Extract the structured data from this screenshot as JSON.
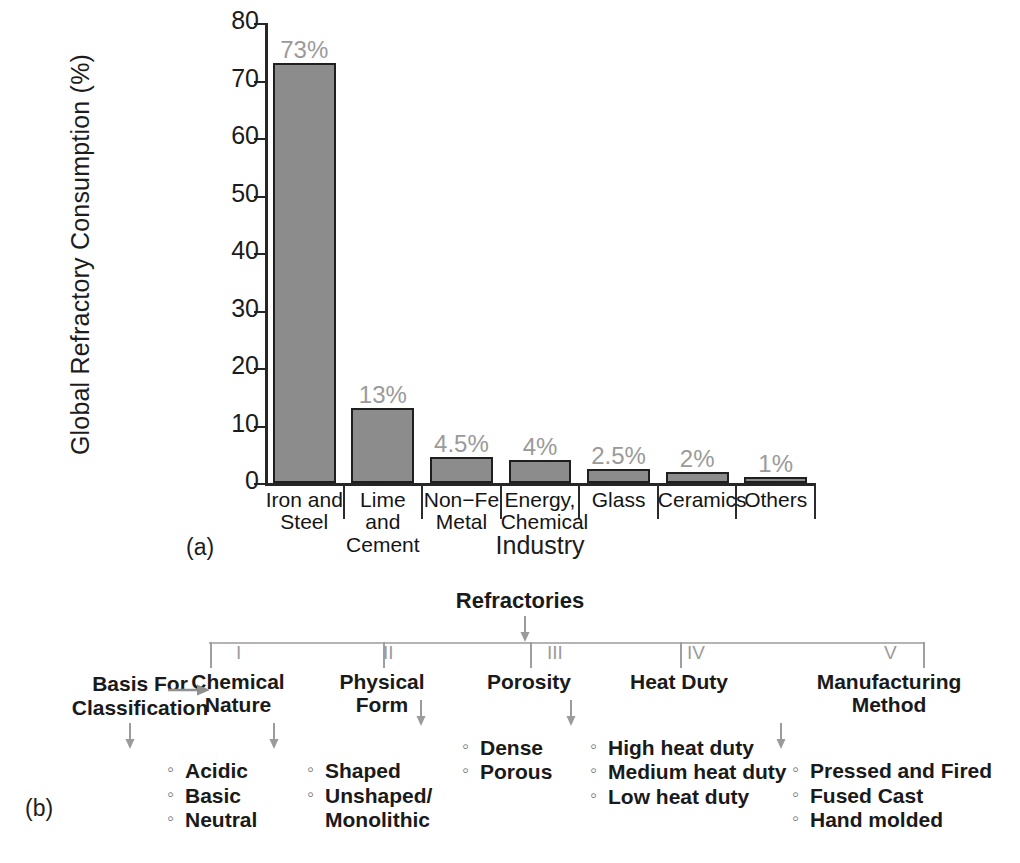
{
  "chart_data": {
    "type": "bar",
    "title": "",
    "xlabel": "Industry",
    "ylabel": "Global Refractory Consumption (%)",
    "ylim": [
      0,
      80
    ],
    "yticks": [
      0,
      10,
      20,
      30,
      40,
      50,
      60,
      70,
      80
    ],
    "grid": false,
    "legend": null,
    "categories": [
      "Iron and\nSteel",
      "Lime and\nCement",
      "Non−Fe\nMetal",
      "Energy,\nChemical",
      "Glass",
      "Ceramics",
      "Others"
    ],
    "values": [
      73,
      13,
      4.5,
      4,
      2.5,
      2,
      1
    ],
    "value_labels": [
      "73%",
      "13%",
      "4.5%",
      "4%",
      "2.5%",
      "2%",
      "1%"
    ],
    "bar_fill_color": "#8c8c8c",
    "bar_edge_color": "#1f1f1f",
    "value_label_color": "#9a9a9a"
  },
  "panel_a": {
    "caption": "(a)"
  },
  "panel_b": {
    "caption": "(b)",
    "title": "Refractories",
    "basis_label": "Basis For\nClassification",
    "bus_color": "#b4b4b4",
    "columns": [
      {
        "roman": "I",
        "heading": "Chemical\nNature",
        "items": [
          "Acidic",
          "Basic",
          "Neutral"
        ]
      },
      {
        "roman": "II",
        "heading": "Physical\nForm",
        "items": [
          "Shaped",
          "Unshaped/\nMonolithic"
        ]
      },
      {
        "roman": "III",
        "heading": "Porosity",
        "items": [
          "Dense",
          "Porous"
        ]
      },
      {
        "roman": "IV",
        "heading": "Heat Duty",
        "items": [
          "High heat duty",
          "Medium heat duty",
          "Low heat duty"
        ]
      },
      {
        "roman": "V",
        "heading": "Manufacturing\nMethod",
        "items": [
          "Pressed and Fired",
          "Fused Cast",
          "Hand molded"
        ]
      }
    ]
  }
}
